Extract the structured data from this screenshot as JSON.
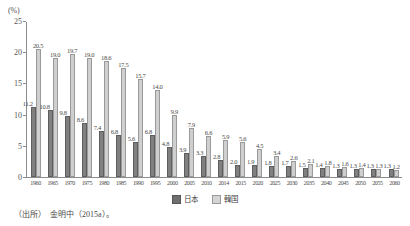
{
  "chart_data": {
    "type": "bar",
    "title": "",
    "subtitle": "",
    "xlabel": "",
    "ylabel": "(%)",
    "unit_label": "(%)",
    "ylim": [
      0,
      25
    ],
    "yticks": [
      0,
      5,
      10,
      15,
      20,
      25
    ],
    "ytick_labels": [
      "0",
      "5",
      "10",
      "15",
      "20",
      "25"
    ],
    "grid": false,
    "legend_position": "bottom-center",
    "categories": [
      "1960",
      "1965",
      "1970",
      "1975",
      "1980",
      "1985",
      "1990",
      "1995",
      "2000",
      "2005",
      "2010",
      "2014",
      "2015",
      "2020",
      "2025",
      "2030",
      "2035",
      "2040",
      "2045",
      "2050",
      "2055",
      "2060"
    ],
    "series": [
      {
        "name": "日本",
        "color": "#808080",
        "values": [
          11.2,
          10.8,
          9.8,
          8.6,
          7.4,
          6.8,
          5.6,
          6.8,
          4.8,
          3.9,
          3.3,
          2.8,
          2.0,
          1.9,
          1.8,
          1.7,
          1.5,
          1.4,
          1.3,
          1.3,
          1.3,
          1.3
        ]
      },
      {
        "name": "韓国",
        "color": "#cfcfcf",
        "values": [
          20.5,
          19.0,
          19.7,
          19.0,
          18.6,
          17.5,
          15.7,
          14.0,
          9.9,
          7.9,
          6.6,
          5.9,
          5.6,
          4.5,
          3.4,
          2.6,
          2.1,
          1.8,
          1.6,
          1.4,
          1.3,
          1.2
        ]
      }
    ]
  },
  "legend": {
    "items": [
      {
        "label": "日本",
        "key": "jp"
      },
      {
        "label": "韓国",
        "key": "kr"
      }
    ]
  },
  "source": {
    "text": "（出所）　金明中（2015a）。"
  }
}
